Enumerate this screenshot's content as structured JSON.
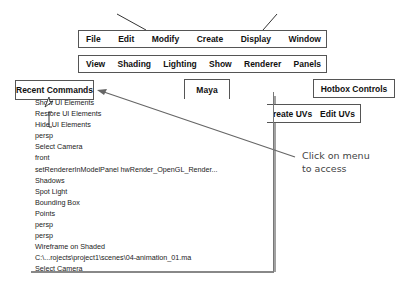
{
  "menu_row_1": [
    "File",
    "Edit",
    "Modify",
    "Create",
    "Display",
    "Window"
  ],
  "menu_row_2": [
    "View",
    "Shading",
    "Lighting",
    "Show",
    "Renderer",
    "Panels"
  ],
  "recent_commands": {
    "title": "Recent Commands",
    "items": [
      "Show UI Elements",
      "Restore UI Elements",
      "Hide UI Elements",
      "persp",
      "Select Camera",
      "front",
      "setRendererInModelPanel hwRender_OpenGL_Render...",
      "Shadows",
      "Spot Light",
      "Bounding Box",
      "Points",
      "persp",
      "persp",
      "Wireframe on Shaded",
      "C:\\...rojects\\project1\\scenes\\04-animation_01.ma",
      "Select Camera"
    ]
  },
  "maya_box": {
    "label": "Maya"
  },
  "hotbox_controls": {
    "label": "Hotbox Controls"
  },
  "uv_menu": {
    "items": [
      "reate UVs",
      "Edit UVs"
    ]
  },
  "callout": {
    "line1": "Click on menu",
    "line2": "to access"
  },
  "colors": {
    "border": "#555555",
    "arrow": "#666666",
    "callout_text": "#444444"
  }
}
